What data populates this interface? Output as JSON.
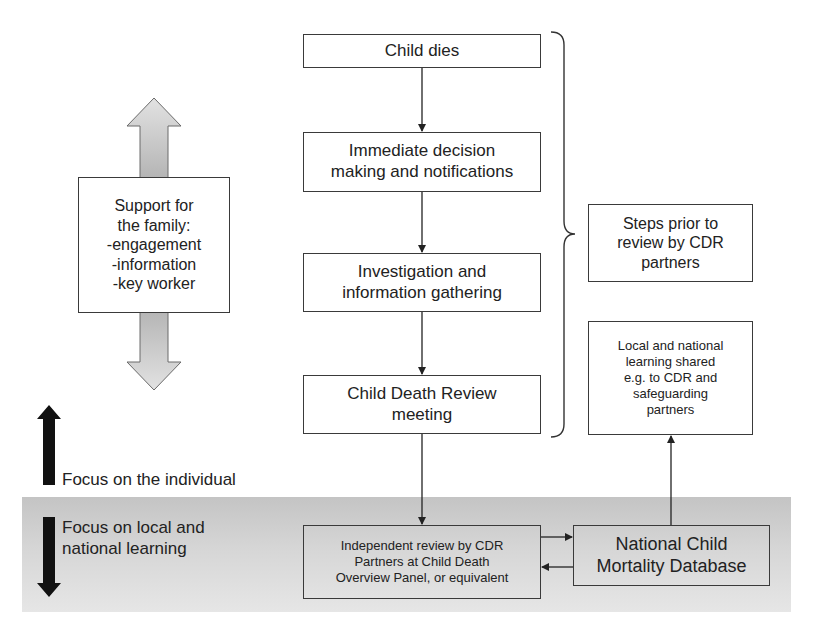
{
  "diagram": {
    "flow": [
      {
        "id": "child-dies",
        "label": "Child dies"
      },
      {
        "id": "immediate-decision",
        "label": "Immediate decision\nmaking and notifications"
      },
      {
        "id": "investigation",
        "label": "Investigation and\ninformation gathering"
      },
      {
        "id": "cdr-meeting",
        "label": "Child Death Review\nmeeting"
      },
      {
        "id": "independent-review",
        "label": "Independent review by CDR\nPartners at Child Death\nOverview Panel, or equivalent"
      }
    ],
    "national_database": {
      "label": "National Child\nMortality Database"
    },
    "learning_shared": {
      "label": "Local and national\nlearning shared\ne.g. to CDR and\nsafeguarding\npartners"
    },
    "steps_prior": {
      "label": "Steps prior to\nreview by CDR\npartners"
    },
    "family_support": {
      "label": "Support for\nthe family:\n-engagement\n-information\n-key worker"
    },
    "focus": {
      "individual": "Focus on the individual",
      "learning": "Focus on local and\nnational learning"
    },
    "colors": {
      "box_border": "#3a3a3a",
      "band_top": "#c4c4c4",
      "band_bottom": "#e6e6e6",
      "family_arrow_light": "#dcdcdc",
      "family_arrow_dark": "#8a8a8a",
      "focus_arrow": "#111111"
    }
  }
}
